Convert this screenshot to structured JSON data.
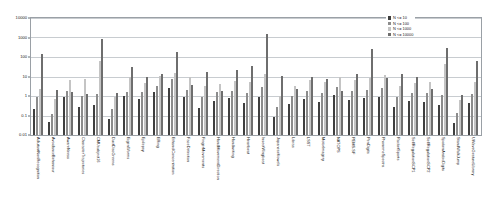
{
  "chart_data": {
    "type": "bar",
    "title": "",
    "subtitle": "",
    "xlabel": "",
    "ylabel": "",
    "yscale": "log",
    "ylim": [
      0.01,
      10000
    ],
    "ytick_labels": [
      "10000",
      "1000",
      "100",
      "10",
      "1",
      "0.1",
      "0.01"
    ],
    "ytick_values": [
      10000,
      1000,
      100,
      10,
      1,
      0.1,
      0.01
    ],
    "grid": true,
    "legend_position": "top-right",
    "categories": [
      "AdiutantNonRecognition",
      "AvoidanceBehaviour",
      "AwareNeess",
      "CharacterTrajectories",
      "CMUsubject16",
      "DuctDiscGreens",
      "EigenWorms",
      "Epilepsy",
      "ERing",
      "EthanolConcentration",
      "FaceDetection",
      "FingerMovements",
      "HandMovementDirection",
      "Handwriting",
      "Heartbeat",
      "InsectWingbeat",
      "JapaneseVowels",
      "Libras",
      "LSST",
      "MotorImagery",
      "NATOPS",
      "PEMS-SF",
      "PenDigits",
      "PhonemeSpectra",
      "RacketSports",
      "SelfRegulationSCP1",
      "SelfRegulationSCP2",
      "SpokenArabicDigits",
      "StandWalkJump",
      "UWaveGestureLibrary"
    ],
    "series": [
      {
        "name": "N <= 10",
        "color": "#3f3f3f",
        "values": [
          0.22,
          0.045,
          0.9,
          0.28,
          0.35,
          0.07,
          0.95,
          0.7,
          1.6,
          2.6,
          0.85,
          0.23,
          0.55,
          0.75,
          0.45,
          0.92,
          0.08,
          0.38,
          0.7,
          0.48,
          1.1,
          0.62,
          0.75,
          0.9,
          0.28,
          0.55,
          0.5,
          0.35,
          0.04,
          0.42
        ]
      },
      {
        "name": "N <= 100",
        "color": "#8c8c8c",
        "values": [
          0.85,
          0.12,
          1.9,
          0.95,
          1.3,
          0.22,
          1.7,
          1.6,
          3.2,
          7.5,
          2.0,
          0.85,
          1.6,
          1.9,
          1.4,
          3.0,
          0.26,
          0.95,
          1.9,
          1.4,
          2.8,
          1.8,
          2.0,
          2.5,
          0.92,
          1.5,
          1.35,
          1.1,
          0.14,
          1.2
        ]
      },
      {
        "name": "N <= 1000",
        "color": "#c4c4c4",
        "values": [
          2.2,
          0.7,
          6.5,
          7.5,
          60,
          0.85,
          9.0,
          4.5,
          11,
          16,
          9.5,
          3.3,
          4.2,
          6.0,
          5.5,
          13,
          1.0,
          3.2,
          7.0,
          5.0,
          9.5,
          6.5,
          8.5,
          12,
          3.4,
          4.8,
          5.2,
          45,
          0.6,
          5.5
        ]
      },
      {
        "name": "N <= 10000",
        "color": "#6e6e6e",
        "values": [
          150,
          2.0,
          1.6,
          1.3,
          800,
          1.5,
          30,
          9.5,
          13,
          190,
          3.5,
          18,
          1.9,
          22,
          35,
          1500,
          11,
          2.2,
          9.0,
          7.5,
          1.9,
          14,
          250,
          8.0,
          14,
          10,
          2.4,
          300,
          1.1,
          60
        ]
      }
    ]
  },
  "legend": {
    "items": [
      {
        "label": "N <= 10"
      },
      {
        "label": "N <= 100"
      },
      {
        "label": "N <= 1000"
      },
      {
        "label": "N <= 10000"
      }
    ]
  }
}
